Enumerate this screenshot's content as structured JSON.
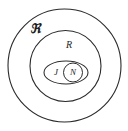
{
  "diagram": {
    "background_color": "#ffffff",
    "stroke_color": "#2b2b2b",
    "sets": [
      {
        "id": "universe",
        "label": "ℜ",
        "shape": "circle",
        "cx": 64.5,
        "cy": 65.5,
        "r": 56.5,
        "label_x": 35,
        "label_y": 30
      },
      {
        "id": "rational",
        "label": "R",
        "shape": "circle",
        "cx": 65.5,
        "cy": 66,
        "r": 35.5,
        "label_x": 69,
        "label_y": 46
      },
      {
        "id": "integer",
        "label": "J",
        "shape": "ellipse",
        "cx": 66,
        "cy": 72.5,
        "rx": 22,
        "ry": 11.5,
        "label_x": 56,
        "label_y": 72.5
      },
      {
        "id": "natural",
        "label": "N",
        "shape": "circle",
        "cx": 73,
        "cy": 72.5,
        "r": 9.5,
        "label_x": 73,
        "label_y": 72.5
      }
    ]
  }
}
